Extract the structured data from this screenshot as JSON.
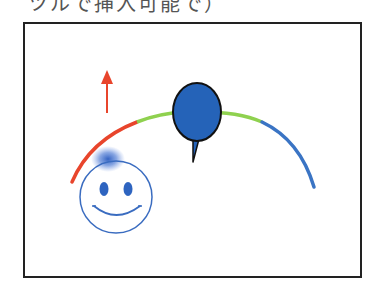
{
  "caption": "ツルで挿入可能で）",
  "diagram": {
    "elements": [
      "up-arrow",
      "arc-red",
      "arc-green",
      "arc-blue",
      "balloon-pin",
      "smiley-face",
      "blur-spot"
    ],
    "colors": {
      "red": "#e8452c",
      "green": "#8fd14f",
      "blue": "#3a74c4",
      "pin": "#2563b8",
      "frame": "#222222"
    }
  }
}
